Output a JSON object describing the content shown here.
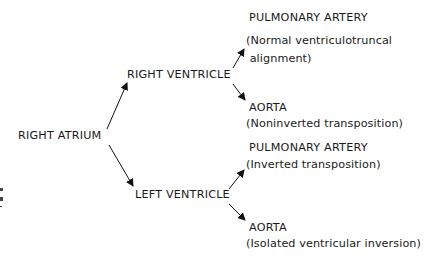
{
  "diagram": {
    "type": "flow-tree",
    "root": {
      "label": "RIGHT ATRIUM"
    },
    "ventricles": [
      {
        "label": "RIGHT VENTRICLE",
        "outcomes": [
          {
            "vessel": "PULMONARY ARTERY",
            "note_line1": "(Normal ventriculotruncal",
            "note_line2": " alignment)"
          },
          {
            "vessel": "AORTA",
            "note_line1": "(Noninverted transposition)"
          }
        ]
      },
      {
        "label": "LEFT VENTRICLE",
        "outcomes": [
          {
            "vessel": "PULMONARY ARTERY",
            "note_line1": "(Inverted transposition)"
          },
          {
            "vessel": "AORTA",
            "note_line1": "(Isolated ventricular inversion)"
          }
        ]
      }
    ],
    "colors": {
      "text": "#1a1a1a",
      "arrow": "#111111",
      "background": "#ffffff"
    }
  }
}
